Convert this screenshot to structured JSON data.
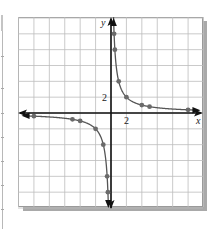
{
  "chart_data": {
    "type": "line",
    "title": "",
    "equation": "y = 4/x",
    "xlabel": "x",
    "ylabel": "y",
    "xlim": [
      -12,
      12
    ],
    "ylim": [
      -12,
      12
    ],
    "grid": true,
    "grid_step": 2,
    "tick_labels": {
      "x": [
        "2"
      ],
      "y": [
        "2"
      ]
    },
    "series": [
      {
        "name": "branch-positive",
        "points": [
          [
            0.4,
            10
          ],
          [
            0.5,
            8
          ],
          [
            1,
            4
          ],
          [
            2,
            2
          ],
          [
            4,
            1
          ],
          [
            5,
            0.8
          ],
          [
            10,
            0.4
          ]
        ]
      },
      {
        "name": "branch-negative",
        "points": [
          [
            -10,
            -0.4
          ],
          [
            -5,
            -0.8
          ],
          [
            -4,
            -1
          ],
          [
            -2,
            -2
          ],
          [
            -1,
            -4
          ],
          [
            -0.5,
            -8
          ],
          [
            -0.4,
            -10
          ]
        ]
      }
    ],
    "colors": {
      "curve": "#555555",
      "points": "#6a6a6a",
      "axes": "#111111",
      "grid": "#bdbdbd",
      "shadow": "#a9a9a9"
    }
  },
  "labels": {
    "x_axis": "x",
    "y_axis": "y",
    "x_tick": "2",
    "y_tick": "2"
  }
}
